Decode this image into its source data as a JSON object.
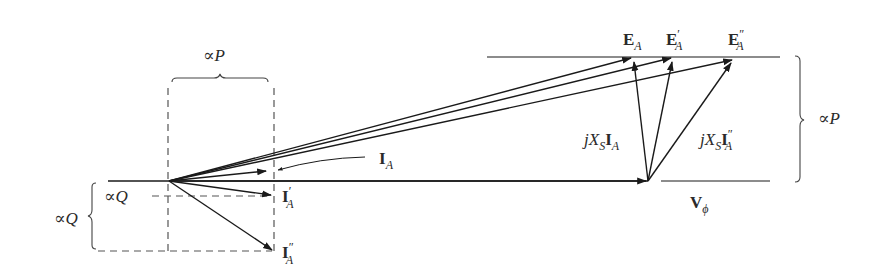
{
  "diagram": {
    "type": "phasor-diagram",
    "labels": {
      "EA": {
        "main": "E",
        "sub": "A",
        "prime": ""
      },
      "EA1": {
        "main": "E",
        "sub": "A",
        "prime": "′"
      },
      "EA2": {
        "main": "E",
        "sub": "A",
        "prime": "″"
      },
      "IA": {
        "main": "I",
        "sub": "A",
        "prime": ""
      },
      "IA1": {
        "main": "I",
        "sub": "A",
        "prime": "′"
      },
      "IA2": {
        "main": "I",
        "sub": "A",
        "prime": "″"
      },
      "Vphi": {
        "main": "V",
        "sub": "ϕ"
      },
      "jXsIA": {
        "j": "j",
        "X": "X",
        "S": "S",
        "I": "I",
        "sub": "A",
        "prime": ""
      },
      "jXsIA2": {
        "j": "j",
        "X": "X",
        "S": "S",
        "I": "I",
        "sub": "A",
        "prime": "″"
      },
      "propP_top": {
        "sym": "∝",
        "var": "P"
      },
      "propP_right": {
        "sym": "∝",
        "var": "P"
      },
      "propQ_inner": {
        "sym": "∝",
        "var": "Q"
      },
      "propQ_outer": {
        "sym": "∝",
        "var": "Q"
      }
    },
    "points": {
      "origin": [
        169,
        181
      ],
      "Vphi_tip": [
        648,
        181
      ],
      "EA_tip": [
        632,
        57
      ],
      "EA1_tip": [
        672,
        57
      ],
      "EA2_tip": [
        733,
        59
      ],
      "IA_tip": [
        268,
        171
      ],
      "IA1_tip": [
        272,
        195
      ],
      "IA2_tip": [
        273,
        251
      ]
    },
    "colors": {
      "line": "#1a1a1a",
      "dashed": "#555555",
      "text": "#2a2a2a"
    }
  }
}
